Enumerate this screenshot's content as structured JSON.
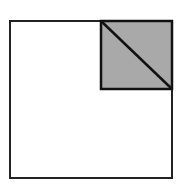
{
  "diagram": {
    "type": "geometry-figure",
    "canvas": {
      "width": 185,
      "height": 188,
      "background": "#ffffff"
    },
    "outer_square": {
      "x": 10,
      "y": 21,
      "width": 162,
      "height": 157,
      "stroke": "#222222",
      "stroke_width": 2,
      "fill": "#ffffff"
    },
    "inner_square": {
      "x": 101,
      "y": 21,
      "width": 71,
      "height": 68,
      "stroke": "#111111",
      "stroke_width": 2.5,
      "fill": "#a9a9a9",
      "position": "top-right corner of outer square",
      "shaded": true
    },
    "diagonal": {
      "x1": 101,
      "y1": 21,
      "x2": 172,
      "y2": 89,
      "stroke": "#111111",
      "stroke_width": 2.5,
      "description": "diagonal from top-left to bottom-right of shaded square"
    }
  }
}
